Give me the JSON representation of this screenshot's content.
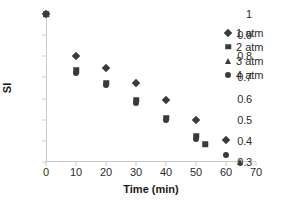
{
  "chart_data": {
    "type": "scatter",
    "title": "",
    "xlabel": "Time (min)",
    "ylabel": "SI",
    "xlim": [
      0,
      70
    ],
    "ylim": [
      0.3,
      1
    ],
    "xticks": [
      0,
      10,
      20,
      30,
      40,
      50,
      60,
      70
    ],
    "xtick_labels": [
      "0",
      "10",
      "20",
      "30",
      "40",
      "50",
      "60",
      "70"
    ],
    "yticks": [
      0.3,
      0.4,
      0.5,
      0.6,
      0.7,
      0.8,
      0.9,
      1
    ],
    "ytick_labels": [
      "0.3",
      "0.4",
      "0.5",
      "0.6",
      "0.7",
      "0.8",
      "0.9",
      "1"
    ],
    "grid": false,
    "legend_position": "upper right",
    "marker_color": "#3a3a3a",
    "axis_color": "#c9c9c9",
    "background": "#ffffff",
    "series": [
      {
        "name": "1 atm",
        "marker": "diamond",
        "x": [
          0,
          10,
          20,
          30,
          40,
          50,
          60
        ],
        "y": [
          1.0,
          0.8,
          0.745,
          0.675,
          0.595,
          0.5,
          0.405
        ]
      },
      {
        "name": "2 atm",
        "marker": "square",
        "x": [
          0,
          10,
          20,
          30,
          40,
          50,
          53
        ],
        "y": [
          1.0,
          0.735,
          0.675,
          0.595,
          0.51,
          0.425,
          0.385
        ]
      },
      {
        "name": "3 atm",
        "marker": "triangle",
        "x": [
          0,
          64.5
        ],
        "y": [
          1.0,
          0.3
        ]
      },
      {
        "name": "4 atm",
        "marker": "circle",
        "x": [
          0,
          10,
          20,
          30,
          40,
          50,
          60
        ],
        "y": [
          1.0,
          0.72,
          0.665,
          0.58,
          0.5,
          0.41,
          0.335
        ]
      }
    ]
  },
  "legend": {
    "entries": [
      {
        "label": "1 atm",
        "marker": "diamond"
      },
      {
        "label": "2 atm",
        "marker": "square"
      },
      {
        "label": "3 atm",
        "marker": "triangle"
      },
      {
        "label": "4 atm",
        "marker": "circle"
      }
    ]
  }
}
